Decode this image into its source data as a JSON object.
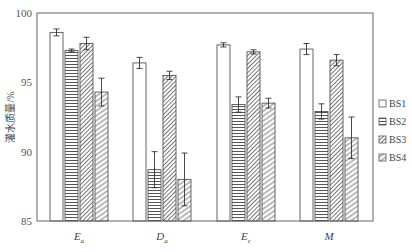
{
  "chart_data": {
    "type": "bar",
    "title": "",
    "xlabel": "",
    "ylabel": "灌水质量/%",
    "ylim": [
      85,
      100
    ],
    "yticks": [
      85,
      90,
      95,
      100
    ],
    "grid": false,
    "legend_position": "right",
    "categories": [
      "E_a",
      "D_a",
      "E_c",
      "M"
    ],
    "category_display": [
      {
        "main": "E",
        "sub": "a"
      },
      {
        "main": "D",
        "sub": "a"
      },
      {
        "main": "E",
        "sub": "c"
      },
      {
        "main": "M",
        "sub": ""
      }
    ],
    "series": [
      {
        "name": "BS1",
        "pattern": "empty",
        "values": [
          98.6,
          96.4,
          97.7,
          97.4
        ],
        "errors": [
          0.25,
          0.4,
          0.15,
          0.4
        ]
      },
      {
        "name": "BS2",
        "pattern": "horizontal",
        "values": [
          97.3,
          88.7,
          93.4,
          92.9
        ],
        "errors": [
          0.1,
          1.3,
          0.55,
          0.55
        ]
      },
      {
        "name": "BS3",
        "pattern": "diagonal-dense",
        "values": [
          97.8,
          95.5,
          97.2,
          96.6
        ],
        "errors": [
          0.45,
          0.3,
          0.15,
          0.4
        ]
      },
      {
        "name": "BS4",
        "pattern": "diagonal-sparse",
        "values": [
          94.3,
          88.0,
          93.5,
          91.0
        ],
        "errors": [
          1.0,
          1.9,
          0.35,
          1.5
        ]
      }
    ]
  }
}
